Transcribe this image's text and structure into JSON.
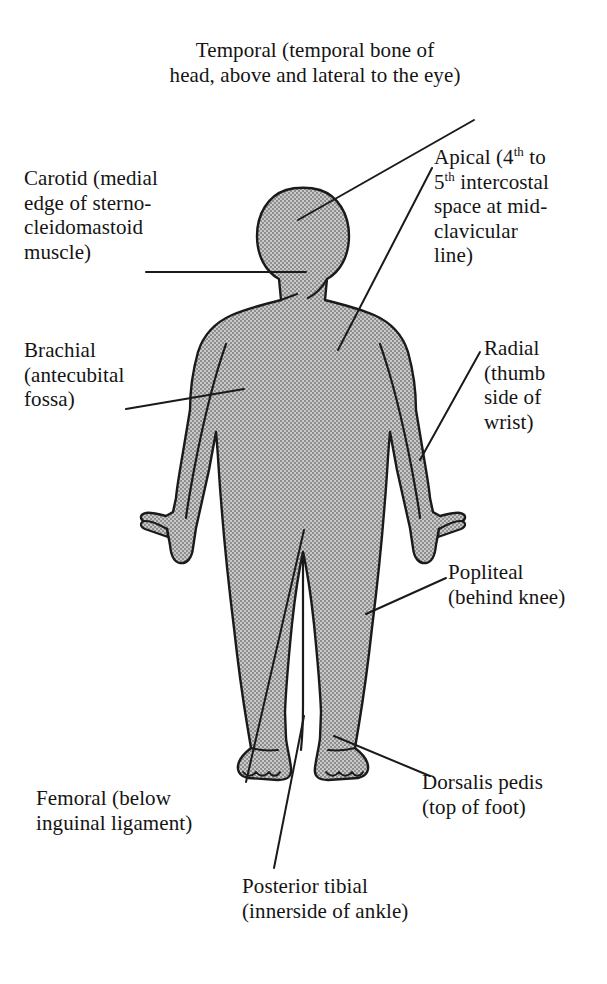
{
  "figure": {
    "body_fill_color": "#a9a9a9",
    "outline_color": "#1a1a1a",
    "background_color": "#ffffff",
    "leader_line_color": "#1a1a1a"
  },
  "labels": {
    "temporal": {
      "name": "Temporal",
      "description": "(temporal bone of\nhead, above and lateral to the eye)",
      "text": "Temporal (temporal bone of\nhead, above and lateral to the eye)"
    },
    "carotid": {
      "name": "Carotid",
      "description": "(medial edge of sterno-cleidomastoid muscle)",
      "text": "Carotid (medial\nedge of sterno-\ncleidomastoid\nmuscle)"
    },
    "apical": {
      "name": "Apical",
      "description": "(4th to 5th intercostal space at mid-clavicular line)",
      "line1_pre": "Apical (4",
      "line1_sup": "th",
      "line1_post": " to",
      "line2_sup": "th",
      "line2_post": " intercostal",
      "line3": "space at mid-",
      "line4": "clavicular",
      "line5": "line)",
      "line2_pre": "5"
    },
    "brachial": {
      "name": "Brachial",
      "description": "(antecubital fossa)",
      "text": "Brachial\n(antecubital\nfossa)"
    },
    "radial": {
      "name": "Radial",
      "description": "(thumb side of wrist)",
      "text": "Radial\n(thumb\nside of\nwrist)"
    },
    "popliteal": {
      "name": "Popliteal",
      "description": "(behind knee)",
      "text": "Popliteal\n(behind knee)"
    },
    "femoral": {
      "name": "Femoral",
      "description": "(below inguinal ligament)",
      "text": "Femoral (below\ninguinal ligament)"
    },
    "dorsalis_pedis": {
      "name": "Dorsalis pedis",
      "description": "(top of foot)",
      "text": "Dorsalis pedis\n(top of foot)"
    },
    "posterior_tibial": {
      "name": "Posterior tibial",
      "description": "(innerside of ankle)",
      "text": "Posterior tibial\n(innerside of ankle)"
    }
  }
}
